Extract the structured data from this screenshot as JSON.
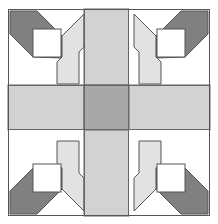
{
  "artwork": {
    "title": "Quilt Block Pattern",
    "kind": "geometric-quilt-block",
    "description": "Symmetric nine-patch quilt block with diagonal log-cabin corner units radiating from a gray center square.",
    "canvas": {
      "width": 218,
      "height": 224,
      "background": "#ffffff"
    }
  },
  "palette": {
    "background": "#ffffff",
    "white": "#ffffff",
    "light_gray": "#d2d2d2",
    "pale_gray": "#e2e2e2",
    "medium_gray": "#a8a8a8",
    "dark_gray": "#808080",
    "outline": "#555555",
    "seam": "#666666"
  },
  "grid": {
    "columns": 3,
    "rows": 3,
    "outer_frame": {
      "x": 8,
      "y": 9,
      "width": 202,
      "height": 207
    },
    "column_edges": [
      8,
      84,
      129,
      210
    ],
    "row_edges": [
      9,
      85,
      130,
      216
    ],
    "cells": [
      {
        "row": 0,
        "col": 0,
        "name": "corner-top-left",
        "fill": "white",
        "unit": "log-cabin-diagonal",
        "diagonal": "nw-se",
        "dark_side": "north-west"
      },
      {
        "row": 0,
        "col": 1,
        "name": "arm-top",
        "fill": "light_gray",
        "unit": "plain-bar"
      },
      {
        "row": 0,
        "col": 2,
        "name": "corner-top-right",
        "fill": "white",
        "unit": "log-cabin-diagonal",
        "diagonal": "ne-sw",
        "dark_side": "north-east"
      },
      {
        "row": 1,
        "col": 0,
        "name": "arm-left",
        "fill": "light_gray",
        "unit": "plain-bar"
      },
      {
        "row": 1,
        "col": 1,
        "name": "center-square",
        "fill": "medium_gray",
        "unit": "plain-square"
      },
      {
        "row": 1,
        "col": 2,
        "name": "arm-right",
        "fill": "light_gray",
        "unit": "plain-bar"
      },
      {
        "row": 2,
        "col": 0,
        "name": "corner-bottom-left",
        "fill": "white",
        "unit": "log-cabin-diagonal",
        "diagonal": "ne-sw",
        "dark_side": "south-west"
      },
      {
        "row": 2,
        "col": 1,
        "name": "arm-bottom",
        "fill": "light_gray",
        "unit": "plain-bar"
      },
      {
        "row": 2,
        "col": 2,
        "name": "corner-bottom-right",
        "fill": "white",
        "unit": "log-cabin-diagonal",
        "diagonal": "nw-se",
        "dark_side": "south-east"
      }
    ]
  },
  "corner_unit": {
    "center_patch": "white-square",
    "bands": [
      {
        "name": "dark-band",
        "fill": "dark_gray",
        "position": "toward-block-corner"
      },
      {
        "name": "pale-band",
        "fill": "pale_gray",
        "position": "toward-block-center"
      }
    ],
    "squares": [
      {
        "name": "white-square-top-left",
        "x": 33,
        "y": 29,
        "size": 28
      },
      {
        "name": "white-square-top-right",
        "x": 157,
        "y": 29,
        "size": 28
      },
      {
        "name": "white-square-bottom-left",
        "x": 33,
        "y": 164,
        "size": 28
      },
      {
        "name": "white-square-bottom-right",
        "x": 157,
        "y": 164,
        "size": 28
      }
    ]
  },
  "labels": {
    "alt_text": "Nine-patch quilt block: white corners with dark gray and pale gray diagonal bands framing small white squares, light gray cross arms, and a medium gray center square."
  }
}
